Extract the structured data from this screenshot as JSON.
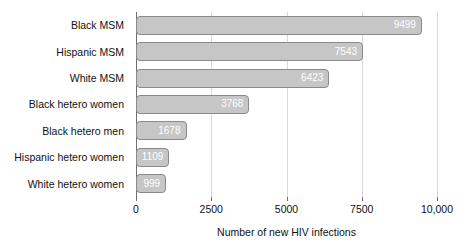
{
  "chart_data": {
    "type": "bar",
    "orientation": "horizontal",
    "title": "",
    "xlabel": "Number of new HIV infections",
    "ylabel": "",
    "xlim": [
      0,
      10000
    ],
    "grid": true,
    "legend": null,
    "xticks": [
      {
        "value": 0,
        "label": "0"
      },
      {
        "value": 2500,
        "label": "2500"
      },
      {
        "value": 5000,
        "label": "5000"
      },
      {
        "value": 7500,
        "label": "7500"
      },
      {
        "value": 10000,
        "label": "10,000"
      }
    ],
    "categories": [
      "Black MSM",
      "Hispanic MSM",
      "White MSM",
      "Black hetero women",
      "Black hetero men",
      "Hispanic hetero women",
      "White hetero women"
    ],
    "values": [
      9499,
      7543,
      6423,
      3768,
      1678,
      1109,
      999
    ],
    "value_labels": [
      "9499",
      "7543",
      "6423",
      "3768",
      "1678",
      "1109",
      "999"
    ],
    "colors": {
      "bar_fill": "#c6c6c6",
      "bar_border": "#8a8a8a",
      "value_label": "#ffffff",
      "gridline": "#d9d9d9",
      "axis": "#6e6e6e",
      "text": "#111111",
      "background": "#ffffff"
    }
  }
}
